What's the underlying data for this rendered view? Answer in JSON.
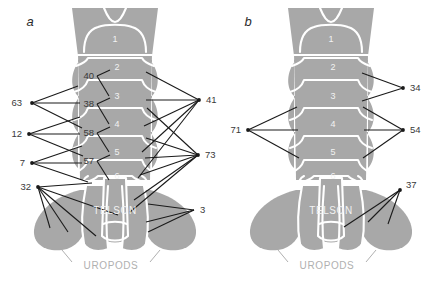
{
  "figure": {
    "type": "anatomical-diagram",
    "background_color": "#ffffff",
    "body_fill_color": "#a8a8a8",
    "body_outline_color": "#ffffff",
    "leader_line_color": "#1a1a1a",
    "callout_text_color": "#3a3a3a",
    "segment_label_color": "#f2f2f2",
    "uropods_label_color": "#b0b0b0"
  },
  "panels": [
    {
      "id": "a",
      "letter": "a",
      "segment_labels": [
        "1",
        "2",
        "3",
        "4",
        "5",
        "6"
      ],
      "region_labels": [
        "TELSON",
        "UROPODS"
      ],
      "interior_callouts": [
        "40",
        "38",
        "58",
        "57"
      ],
      "left_callouts": [
        "63",
        "12",
        "7",
        "32"
      ],
      "right_callouts": [
        "41",
        "73",
        "3"
      ]
    },
    {
      "id": "b",
      "letter": "b",
      "segment_labels": [
        "1",
        "2",
        "3",
        "4",
        "5",
        "6"
      ],
      "region_labels": [
        "TELSON",
        "UROPODS"
      ],
      "interior_callouts": [],
      "left_callouts": [
        "71"
      ],
      "right_callouts": [
        "34",
        "54",
        "37"
      ]
    }
  ],
  "callouts": {
    "a_40": "40",
    "a_38": "38",
    "a_58": "58",
    "a_57": "57",
    "a_63": "63",
    "a_12": "12",
    "a_7": "7",
    "a_32": "32",
    "a_41": "41",
    "a_73": "73",
    "a_3": "3",
    "b_71": "71",
    "b_34": "34",
    "b_54": "54",
    "b_37": "37"
  },
  "segments_a": {
    "s1": "1",
    "s2": "2",
    "s3": "3",
    "s4": "4",
    "s5": "5",
    "s6": "6",
    "telson": "TELSON",
    "uropods": "UROPODS"
  },
  "segments_b": {
    "s1": "1",
    "s2": "2",
    "s3": "3",
    "s4": "4",
    "s5": "5",
    "s6": "6",
    "telson": "TELSON",
    "uropods": "UROPODS"
  },
  "panel_a_letter": "a",
  "panel_b_letter": "b"
}
